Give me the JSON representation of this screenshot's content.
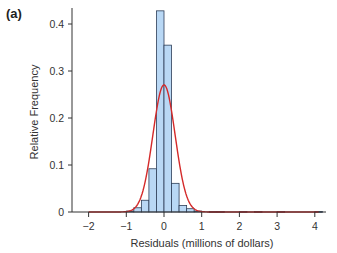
{
  "panel_label": "(a)",
  "chart_data": {
    "type": "bar",
    "title": "",
    "xlabel": "Residuals (millions of dollars)",
    "ylabel": "Relative Frequency",
    "xlim": [
      -2.3,
      4.3
    ],
    "ylim": [
      0,
      0.43
    ],
    "xticks": [
      -2,
      -1,
      0,
      1,
      2,
      3,
      4
    ],
    "xtick_labels": [
      "−2",
      "−1",
      "0",
      "1",
      "2",
      "3",
      "4"
    ],
    "yticks": [
      0,
      0.1,
      0.2,
      0.3,
      0.4
    ],
    "ytick_labels": [
      "0",
      "0.1",
      "0.2",
      "0.3",
      "0.4"
    ],
    "grid": false,
    "legend": null,
    "bin_width": 0.2,
    "bins": [
      {
        "x0": -1.0,
        "x1": -0.8,
        "value": 0.002
      },
      {
        "x0": -0.8,
        "x1": -0.6,
        "value": 0.009
      },
      {
        "x0": -0.6,
        "x1": -0.4,
        "value": 0.025
      },
      {
        "x0": -0.4,
        "x1": -0.2,
        "value": 0.092
      },
      {
        "x0": -0.2,
        "x1": 0.0,
        "value": 0.428
      },
      {
        "x0": 0.0,
        "x1": 0.2,
        "value": 0.355
      },
      {
        "x0": 0.2,
        "x1": 0.4,
        "value": 0.061
      },
      {
        "x0": 0.4,
        "x1": 0.6,
        "value": 0.014
      },
      {
        "x0": 0.6,
        "x1": 0.8,
        "value": 0.007
      },
      {
        "x0": 0.8,
        "x1": 1.0,
        "value": 0.002
      },
      {
        "x0": 1.2,
        "x1": 1.4,
        "value": 0.001
      },
      {
        "x0": 1.4,
        "x1": 1.6,
        "value": 0.001
      },
      {
        "x0": 2.0,
        "x1": 2.2,
        "value": 0.001
      },
      {
        "x0": 2.4,
        "x1": 2.6,
        "value": 0.001
      },
      {
        "x0": 3.0,
        "x1": 3.2,
        "value": 0.001
      },
      {
        "x0": 4.0,
        "x1": 4.2,
        "value": 0.001
      }
    ],
    "overlay": {
      "type": "normal_curve",
      "mean": 0.0,
      "sd": 0.295,
      "scale": 0.2,
      "peak": 0.27,
      "x_range": [
        -2,
        4.1
      ],
      "color": "#d42a2a"
    },
    "colors": {
      "bar_fill": "#b9d8f5",
      "bar_stroke": "#2d3e57",
      "axis": "#333333"
    }
  }
}
